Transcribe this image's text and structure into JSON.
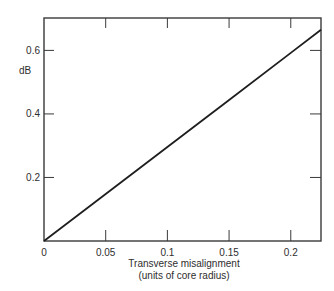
{
  "chart_data": {
    "type": "line",
    "title": "",
    "xlabel": "Transverse misalignment",
    "xlabel_line2": "(units of core radius)",
    "ylabel": "dB",
    "xlim": [
      0,
      0.2245
    ],
    "ylim": [
      0,
      0.702
    ],
    "x_ticks": [
      0,
      0.05,
      0.1,
      0.15,
      0.2
    ],
    "x_tick_labels": [
      "0",
      "0.05",
      "0.1",
      "0.15",
      "0.2"
    ],
    "y_ticks": [
      0.2,
      0.4,
      0.6
    ],
    "y_tick_labels": [
      "0.2",
      "0.4",
      "0.6"
    ],
    "grid": false,
    "legend": null,
    "series": [
      {
        "name": "Loss vs transverse misalignment",
        "x": [
          0,
          0.05,
          0.1,
          0.15,
          0.2,
          0.2245
        ],
        "y": [
          0,
          0.148,
          0.296,
          0.444,
          0.592,
          0.665
        ]
      }
    ]
  },
  "style": {
    "line_color": "#1e1e1e",
    "frame_color": "#3a3a3a",
    "text_color": "#2e2e2e",
    "background": "#ffffff"
  }
}
